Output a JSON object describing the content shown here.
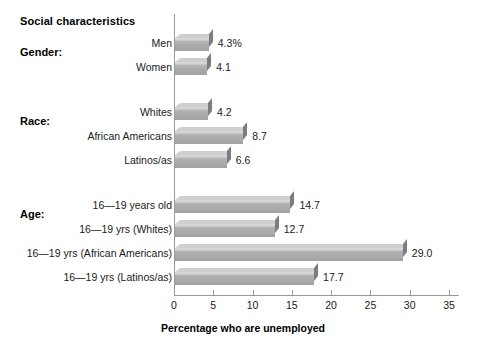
{
  "chart_data": {
    "type": "bar",
    "orientation": "horizontal",
    "title": "Social characteristics",
    "xlabel": "Percentage who are unemployed",
    "ylabel": "",
    "xlim": [
      0,
      35
    ],
    "xticks": [
      0,
      5,
      10,
      15,
      20,
      25,
      30,
      35
    ],
    "grid": false,
    "legend": "none",
    "value_suffix_first": "%",
    "groups": [
      {
        "heading": "Gender:",
        "categories": [
          "Men",
          "Women"
        ],
        "values": [
          4.3,
          4.1
        ],
        "value_labels": [
          "4.3%",
          "4.1"
        ]
      },
      {
        "heading": "Race:",
        "categories": [
          "Whites",
          "African Americans",
          "Latinos/as"
        ],
        "values": [
          4.2,
          8.7,
          6.6
        ],
        "value_labels": [
          "4.2",
          "8.7",
          "6.6"
        ]
      },
      {
        "heading": "Age:",
        "categories": [
          "16—19 years old",
          "16—19 yrs (Whites)",
          "16—19 yrs (African Americans)",
          "16—19 yrs (Latinos/as)"
        ],
        "values": [
          14.7,
          12.7,
          29.0,
          17.7
        ],
        "value_labels": [
          "14.7",
          "12.7",
          "29.0",
          "17.7"
        ]
      }
    ],
    "categories": [
      "Men",
      "Women",
      "Whites",
      "African Americans",
      "Latinos/as",
      "16—19 years old",
      "16—19 yrs (Whites)",
      "16—19 yrs (African Americans)",
      "16—19 yrs (Latinos/as)"
    ],
    "values": [
      4.3,
      4.1,
      4.2,
      8.7,
      6.6,
      14.7,
      12.7,
      29.0,
      17.7
    ],
    "colors": {
      "bar_face": "#a9a9a9",
      "bar_top": "#cfcfcf",
      "bar_side": "#7d7d7d",
      "axis": "#9a9a9a",
      "text": "#1a1a1a",
      "background": "#ffffff"
    }
  },
  "bars": [
    {
      "label": "Men",
      "value_label": "4.3%",
      "value": 4.3,
      "y": 24
    },
    {
      "label": "Women",
      "value_label": "4.1",
      "value": 4.1,
      "y": 48
    },
    {
      "label": "Whites",
      "value_label": "4.2",
      "value": 4.2,
      "y": 93
    },
    {
      "label": "African Americans",
      "value_label": "8.7",
      "value": 8.7,
      "y": 117
    },
    {
      "label": "Latinos/as",
      "value_label": "6.6",
      "value": 6.6,
      "y": 141
    },
    {
      "label": "16—19 years old",
      "value_label": "14.7",
      "value": 14.7,
      "y": 186
    },
    {
      "label": "16—19 yrs (Whites)",
      "value_label": "12.7",
      "value": 12.7,
      "y": 210
    },
    {
      "label": "16—19 yrs (African Americans)",
      "value_label": "29.0",
      "value": 29.0,
      "y": 234
    },
    {
      "label": "16—19 yrs (Latinos/as)",
      "value_label": "17.7",
      "value": 17.7,
      "y": 258
    }
  ],
  "group_headings": [
    {
      "text": "Gender:",
      "top": 46
    },
    {
      "text": "Race:",
      "top": 115
    },
    {
      "text": "Age:",
      "top": 208
    }
  ]
}
